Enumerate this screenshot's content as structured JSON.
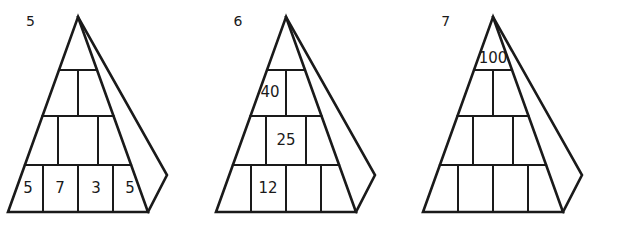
{
  "figure_set": {
    "background_color": "#ffffff",
    "line_color": "#1a1a1a",
    "figures": [
      {
        "label": "5",
        "name": "pyramid-5",
        "rows": [
          {
            "index": 1,
            "cells": [
              {
                "value": ""
              }
            ]
          },
          {
            "index": 2,
            "cells": [
              {
                "value": ""
              },
              {
                "value": ""
              }
            ]
          },
          {
            "index": 3,
            "cells": [
              {
                "value": ""
              },
              {
                "value": ""
              },
              {
                "value": ""
              }
            ]
          },
          {
            "index": 4,
            "cells": [
              {
                "value": "5"
              },
              {
                "value": "7"
              },
              {
                "value": "3"
              },
              {
                "value": "5"
              }
            ]
          }
        ]
      },
      {
        "label": "6",
        "name": "pyramid-6",
        "rows": [
          {
            "index": 1,
            "cells": [
              {
                "value": ""
              }
            ]
          },
          {
            "index": 2,
            "cells": [
              {
                "value": "40"
              },
              {
                "value": ""
              }
            ]
          },
          {
            "index": 3,
            "cells": [
              {
                "value": ""
              },
              {
                "value": "25"
              },
              {
                "value": ""
              }
            ]
          },
          {
            "index": 4,
            "cells": [
              {
                "value": ""
              },
              {
                "value": "12"
              },
              {
                "value": ""
              },
              {
                "value": ""
              }
            ]
          }
        ]
      },
      {
        "label": "7",
        "name": "pyramid-7",
        "rows": [
          {
            "index": 1,
            "cells": [
              {
                "value": "100"
              }
            ]
          },
          {
            "index": 2,
            "cells": [
              {
                "value": ""
              },
              {
                "value": ""
              }
            ]
          },
          {
            "index": 3,
            "cells": [
              {
                "value": ""
              },
              {
                "value": ""
              },
              {
                "value": ""
              }
            ]
          },
          {
            "index": 4,
            "cells": [
              {
                "value": ""
              },
              {
                "value": ""
              },
              {
                "value": ""
              },
              {
                "value": ""
              }
            ]
          }
        ]
      }
    ]
  }
}
